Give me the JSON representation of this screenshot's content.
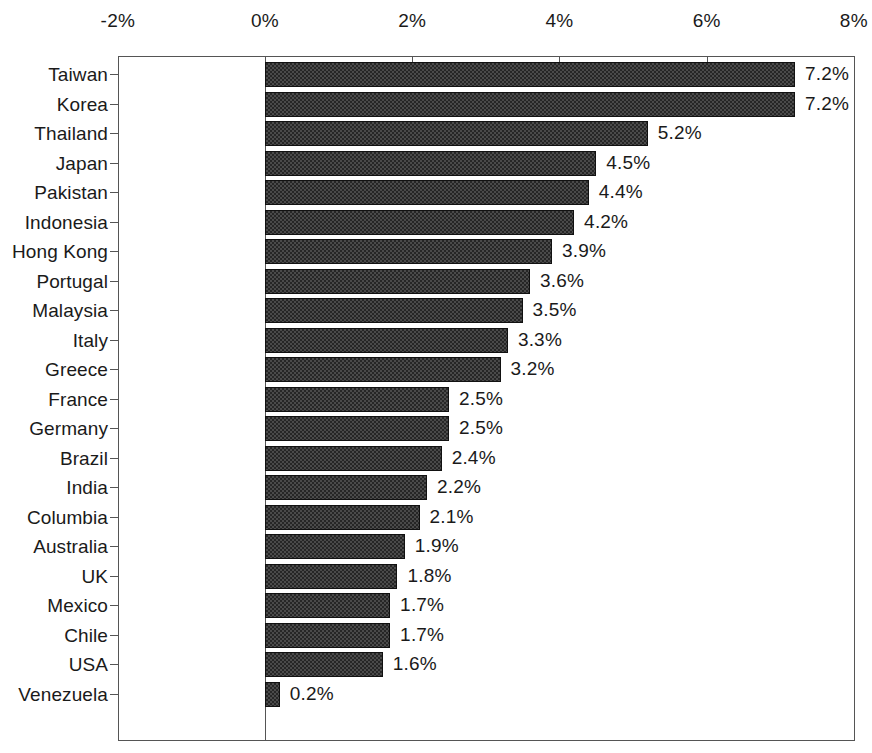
{
  "chart_data": {
    "type": "bar",
    "orientation": "horizontal",
    "title": "",
    "xlabel": "",
    "ylabel": "",
    "xlim": [
      -2,
      8
    ],
    "xticks": [
      -2,
      0,
      2,
      4,
      6,
      8
    ],
    "xtick_labels": [
      "-2%",
      "0%",
      "2%",
      "4%",
      "6%",
      "8%"
    ],
    "grid": false,
    "legend": "none",
    "value_label_format": "%0.1f%%",
    "categories": [
      "Taiwan",
      "Korea",
      "Thailand",
      "Japan",
      "Pakistan",
      "Indonesia",
      "Hong Kong",
      "Portugal",
      "Malaysia",
      "Italy",
      "Greece",
      "France",
      "Germany",
      "Brazil",
      "India",
      "Columbia",
      "Australia",
      "UK",
      "Mexico",
      "Chile",
      "USA",
      "Venezuela"
    ],
    "values": [
      7.2,
      7.2,
      5.2,
      4.5,
      4.4,
      4.2,
      3.9,
      3.6,
      3.5,
      3.3,
      3.2,
      2.5,
      2.5,
      2.4,
      2.2,
      2.1,
      1.9,
      1.8,
      1.7,
      1.7,
      1.6,
      0.2
    ],
    "value_labels": [
      "7.2%",
      "7.2%",
      "5.2%",
      "4.5%",
      "4.4%",
      "4.2%",
      "3.9%",
      "3.6%",
      "3.5%",
      "3.3%",
      "3.2%",
      "2.5%",
      "2.5%",
      "2.4%",
      "2.2%",
      "2.1%",
      "1.9%",
      "1.8%",
      "1.7%",
      "1.7%",
      "1.6%",
      "0.2%"
    ],
    "colors": {
      "bar_fill": "#262626",
      "bar_pattern": "#4a4a4a",
      "bar_edge": "#111111",
      "axis": "#555555",
      "text": "#1a1a1a",
      "background": "#ffffff"
    }
  }
}
